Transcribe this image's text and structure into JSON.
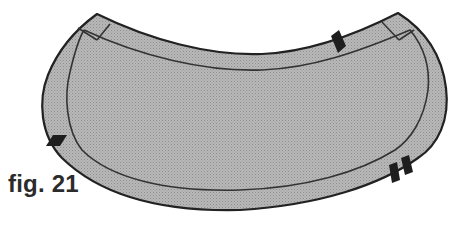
{
  "figure": {
    "label": "fig. 21"
  },
  "colors": {
    "fill": "#b4b4b4",
    "fill_dots": "#9a9a9a",
    "outline": "#222222",
    "seam_line": "#333333",
    "notch": "#1e1e1e",
    "background": "#ffffff"
  },
  "notches": [
    {
      "name": "top-notch",
      "count": 1
    },
    {
      "name": "left-notch",
      "count": 1
    },
    {
      "name": "bottom-right-notch",
      "count": 2
    }
  ]
}
